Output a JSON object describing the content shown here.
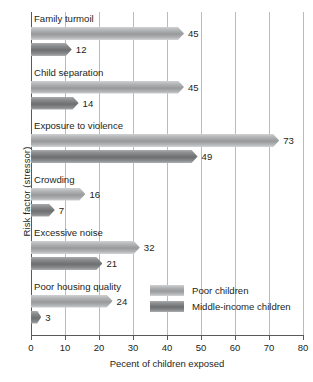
{
  "chart_data": {
    "type": "bar",
    "orientation": "horizontal",
    "title": "",
    "xlabel": "Pecent of children exposed",
    "ylabel": "Risk factor (stressor)",
    "xlim": [
      0,
      80
    ],
    "xticks": [
      0,
      10,
      20,
      30,
      40,
      50,
      60,
      70,
      80
    ],
    "grid": "vertical",
    "legend_position": "inside-bottom-right",
    "categories": [
      "Family turmoil",
      "Child separation",
      "Exposure to violence",
      "Crowding",
      "Excessive noise",
      "Poor housing quality"
    ],
    "series": [
      {
        "name": "Poor children",
        "color": "#a9abad",
        "values": [
          45,
          45,
          73,
          16,
          32,
          24
        ]
      },
      {
        "name": "Middle-income children",
        "color": "#7d7f81",
        "values": [
          12,
          14,
          49,
          7,
          21,
          3
        ]
      }
    ]
  },
  "legend": {
    "items": [
      {
        "label": "Poor children"
      },
      {
        "label": "Middle-income children"
      }
    ]
  }
}
